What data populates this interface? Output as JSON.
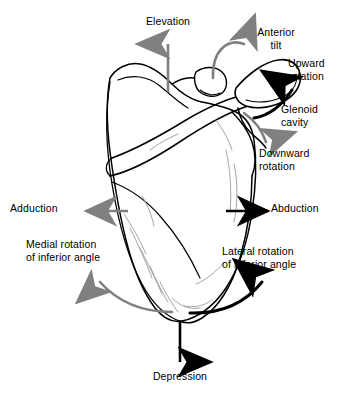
{
  "diagram": {
    "view": "posterior view of right scapula with motion arrows",
    "background_color": "#ffffff",
    "bone_outline_color": "#000000",
    "bone_detail_color": "#9a9a9a",
    "arrow_black_color": "#000000",
    "arrow_gray_color": "#808080"
  },
  "labels": {
    "elevation": "Elevation",
    "anterior_tilt": "Anterior\ntilt",
    "upward_rotation": "Upward\nrotation",
    "glenoid_cavity": "Glenoid\ncavity",
    "downward_rotation": "Downward\nrotation",
    "adduction": "Adduction",
    "abduction": "Abduction",
    "medial_rotation": "Medial rotation\nof inferior angle",
    "lateral_rotation": "Lateral rotation\nof inferior angle",
    "depression": "Depression"
  },
  "arrows": [
    {
      "name": "elevation-arrow",
      "style": "straight",
      "direction": "up",
      "color": "#808080"
    },
    {
      "name": "anterior-tilt-arrow",
      "style": "curved",
      "direction": "over-and-down",
      "color": "#808080"
    },
    {
      "name": "upward-rotation-arrow",
      "style": "curved",
      "direction": "up-right",
      "color": "#000000"
    },
    {
      "name": "downward-rotation-arrow",
      "style": "curved",
      "direction": "down-right",
      "color": "#808080"
    },
    {
      "name": "adduction-arrow",
      "style": "straight",
      "direction": "left",
      "color": "#808080"
    },
    {
      "name": "abduction-arrow",
      "style": "straight",
      "direction": "right",
      "color": "#000000"
    },
    {
      "name": "medial-rotation-arrow",
      "style": "curved",
      "direction": "up-left",
      "color": "#808080"
    },
    {
      "name": "lateral-rotation-arrow",
      "style": "curved",
      "direction": "up-right",
      "color": "#000000"
    },
    {
      "name": "depression-arrow",
      "style": "straight",
      "direction": "down",
      "color": "#000000"
    }
  ]
}
